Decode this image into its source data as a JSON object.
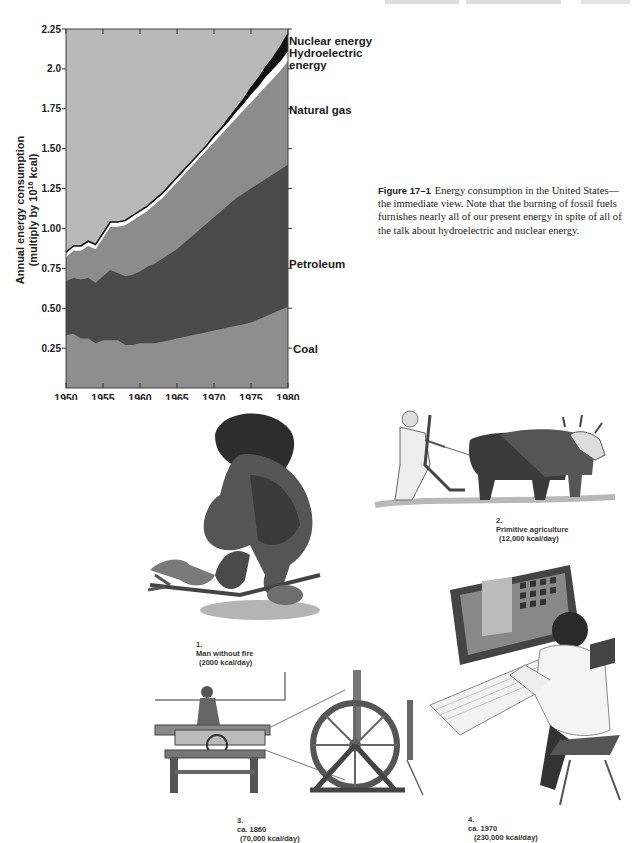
{
  "page": {
    "header_partial": "(cropped running header text)"
  },
  "figure": {
    "label": "Figure 17–1",
    "caption": "Energy consumption in the United States—the immediate view. Note that the burning of fossil fuels furnishes nearly all of our present energy in spite of all of the talk about hydroelectric and nuclear energy."
  },
  "chart_data": {
    "type": "area",
    "title": "",
    "xlabel": "",
    "ylabel": "Annual energy consumption (multiply by 10^16 kcal)",
    "ylabel_line1": "Annual energy consumption",
    "ylabel_line2": "(multiply by 10",
    "ylabel_sup": "16",
    "ylabel_line2_end": " kcal)",
    "xlim": [
      1950,
      1980
    ],
    "ylim": [
      0,
      2.25
    ],
    "x_ticks": [
      "1950",
      "1955",
      "1960",
      "1965",
      "1970",
      "1975",
      "1980"
    ],
    "y_ticks": [
      "0.25",
      "0.50",
      "0.75",
      "1.00",
      "1.25",
      "1.50",
      "1.75",
      "2.0",
      "2.25"
    ],
    "grid": false,
    "stacked": true,
    "legend_position": "right-inline",
    "x": [
      1950,
      1951,
      1952,
      1953,
      1954,
      1955,
      1956,
      1957,
      1958,
      1959,
      1960,
      1961,
      1962,
      1963,
      1964,
      1965,
      1966,
      1967,
      1968,
      1969,
      1970,
      1971,
      1972,
      1973,
      1974,
      1975,
      1976,
      1977,
      1978,
      1979,
      1980
    ],
    "series": [
      {
        "name": "Coal",
        "cumulative_top": [
          0.33,
          0.34,
          0.31,
          0.31,
          0.28,
          0.3,
          0.3,
          0.3,
          0.27,
          0.27,
          0.28,
          0.28,
          0.28,
          0.29,
          0.3,
          0.31,
          0.32,
          0.33,
          0.34,
          0.35,
          0.36,
          0.37,
          0.38,
          0.39,
          0.4,
          0.41,
          0.43,
          0.45,
          0.47,
          0.49,
          0.51
        ],
        "color": "#8e8e8e"
      },
      {
        "name": "Petroleum",
        "cumulative_top": [
          0.67,
          0.69,
          0.68,
          0.69,
          0.66,
          0.7,
          0.74,
          0.72,
          0.7,
          0.71,
          0.73,
          0.76,
          0.78,
          0.81,
          0.84,
          0.87,
          0.91,
          0.95,
          0.99,
          1.03,
          1.07,
          1.11,
          1.15,
          1.19,
          1.22,
          1.25,
          1.28,
          1.31,
          1.34,
          1.37,
          1.4
        ],
        "color": "#4a4a4a"
      },
      {
        "name": "Natural gas",
        "cumulative_top": [
          0.82,
          0.86,
          0.86,
          0.89,
          0.87,
          0.94,
          1.01,
          1.01,
          1.02,
          1.05,
          1.08,
          1.11,
          1.15,
          1.19,
          1.24,
          1.29,
          1.34,
          1.39,
          1.44,
          1.49,
          1.54,
          1.59,
          1.64,
          1.69,
          1.74,
          1.79,
          1.84,
          1.89,
          1.94,
          1.99,
          2.05
        ],
        "color": "#8c8c8c"
      },
      {
        "name": "Hydroelectric energy",
        "cumulative_top": [
          0.85,
          0.89,
          0.89,
          0.92,
          0.9,
          0.97,
          1.04,
          1.04,
          1.05,
          1.08,
          1.11,
          1.14,
          1.18,
          1.22,
          1.27,
          1.32,
          1.37,
          1.42,
          1.47,
          1.52,
          1.57,
          1.62,
          1.67,
          1.73,
          1.78,
          1.84,
          1.89,
          1.95,
          2.0,
          2.05,
          2.11
        ],
        "color": "#ffffff"
      },
      {
        "name": "Nuclear energy",
        "cumulative_top": [
          0.85,
          0.89,
          0.89,
          0.92,
          0.9,
          0.97,
          1.04,
          1.04,
          1.05,
          1.08,
          1.11,
          1.14,
          1.18,
          1.22,
          1.27,
          1.32,
          1.37,
          1.42,
          1.47,
          1.52,
          1.58,
          1.63,
          1.69,
          1.75,
          1.81,
          1.88,
          1.94,
          2.01,
          2.07,
          2.14,
          2.22
        ],
        "color": "#111111"
      }
    ],
    "background_color": "#b9b9b9",
    "labels": {
      "nuclear": "Nuclear energy",
      "hydro_line1": "Hydroelectric",
      "hydro_line2": "energy",
      "gas": "Natural gas",
      "petroleum": "Petroleum",
      "coal": "Coal"
    }
  },
  "illustrations": [
    {
      "id": 1,
      "number": "1.",
      "title": "Man without fire",
      "energy": "(2000 kcal/day)",
      "icon": "caveman-illustration"
    },
    {
      "id": 2,
      "number": "2.",
      "title": "Primitive agriculture",
      "energy": "(12,000 kcal/day)",
      "icon": "ox-plow-illustration"
    },
    {
      "id": 3,
      "number": "3.",
      "title": "ca. 1860",
      "energy": "(70,000 kcal/day)",
      "icon": "lathe-wheel-illustration"
    },
    {
      "id": 4,
      "number": "4.",
      "title": "ca. 1970",
      "energy": "(230,000 kcal/day)",
      "icon": "computer-operator-illustration"
    }
  ]
}
